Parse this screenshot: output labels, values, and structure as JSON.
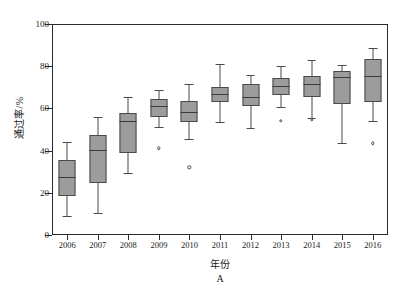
{
  "chart_data": {
    "type": "box",
    "title": "",
    "panel_label": "A",
    "xlabel": "年份",
    "ylabel": "通过率/%",
    "ylim": [
      0,
      100
    ],
    "yticks": [
      0,
      20,
      40,
      60,
      80,
      100
    ],
    "grid": false,
    "legend": null,
    "categories": [
      "2006",
      "2007",
      "2008",
      "2009",
      "2010",
      "2011",
      "2012",
      "2013",
      "2014",
      "2015",
      "2016"
    ],
    "boxes": [
      {
        "category": "2006",
        "whisker_low": 9.0,
        "q1": 18.5,
        "median": 27.5,
        "q3": 35.5,
        "whisker_high": 44.0,
        "outliers": []
      },
      {
        "category": "2007",
        "whisker_low": 10.5,
        "q1": 24.5,
        "median": 40.5,
        "q3": 47.5,
        "whisker_high": 56.0,
        "outliers": []
      },
      {
        "category": "2008",
        "whisker_low": 29.5,
        "q1": 39.0,
        "median": 54.0,
        "q3": 58.0,
        "whisker_high": 65.5,
        "outliers": []
      },
      {
        "category": "2009",
        "whisker_low": 51.0,
        "q1": 56.0,
        "median": 61.0,
        "q3": 64.5,
        "whisker_high": 68.5,
        "outliers": [
          41.0
        ]
      },
      {
        "category": "2010",
        "whisker_low": 45.5,
        "q1": 53.5,
        "median": 58.5,
        "q3": 63.5,
        "whisker_high": 71.5,
        "outliers": [
          32.0
        ]
      },
      {
        "category": "2011",
        "whisker_low": 53.5,
        "q1": 63.0,
        "median": 67.0,
        "q3": 70.0,
        "whisker_high": 81.0,
        "outliers": []
      },
      {
        "category": "2012",
        "whisker_low": 50.5,
        "q1": 61.0,
        "median": 65.5,
        "q3": 71.5,
        "whisker_high": 76.0,
        "outliers": []
      },
      {
        "category": "2013",
        "whisker_low": 60.5,
        "q1": 66.5,
        "median": 70.5,
        "q3": 74.5,
        "whisker_high": 80.0,
        "outliers": [
          54.0
        ]
      },
      {
        "category": "2014",
        "whisker_low": 55.5,
        "q1": 65.5,
        "median": 71.5,
        "q3": 75.5,
        "whisker_high": 83.0,
        "outliers": [
          54.5
        ]
      },
      {
        "category": "2015",
        "whisker_low": 43.5,
        "q1": 62.0,
        "median": 75.0,
        "q3": 77.5,
        "whisker_high": 80.5,
        "outliers": []
      },
      {
        "category": "2016",
        "whisker_low": 54.0,
        "q1": 63.0,
        "median": 75.5,
        "q3": 83.5,
        "whisker_high": 88.5,
        "outliers": [
          43.5
        ]
      }
    ],
    "colors": {
      "box_fill": "#9c9c9c",
      "box_edge": "#4a4a4a",
      "median": "#3a3a3a",
      "axis": "#2b2b2b",
      "background": "#ffffff"
    }
  }
}
